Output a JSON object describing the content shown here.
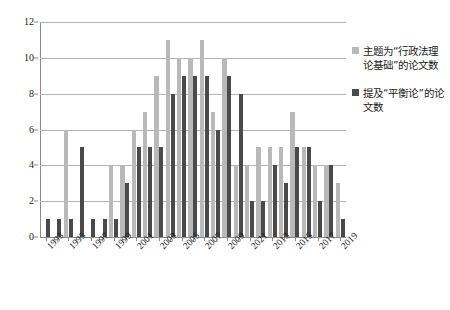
{
  "chart_data": {
    "type": "bar",
    "title": "",
    "xlabel": "",
    "ylabel": "",
    "ylim": [
      0,
      12
    ],
    "y_ticks": [
      0,
      2,
      4,
      6,
      8,
      10,
      12
    ],
    "grid": true,
    "legend_position": "right",
    "categories": [
      "1993",
      "1994",
      "1995",
      "1996",
      "1997",
      "1998",
      "1999",
      "2000",
      "2001",
      "2002",
      "2003",
      "2004",
      "2005",
      "2006",
      "2007",
      "2008",
      "2009",
      "2010",
      "2021",
      "2012",
      "2013",
      "2014",
      "2015",
      "2016",
      "2017",
      "2018",
      "2019"
    ],
    "x_tick_labels": [
      "1993",
      "1995",
      "1997",
      "1999",
      "2001",
      "2003",
      "2005",
      "2007",
      "2009",
      "2021",
      "2013",
      "2015",
      "2017",
      "2019"
    ],
    "series": [
      {
        "name": "主题为“行政法理论基础”的论文数",
        "color": "#b9b9b9",
        "values": [
          0,
          0,
          6,
          0,
          0,
          0,
          4,
          4,
          6,
          7,
          9,
          11,
          10,
          10,
          11,
          7,
          10,
          4,
          4,
          5,
          5,
          5,
          7,
          5,
          4,
          4,
          3
        ]
      },
      {
        "name": "提及“平衡论”的论文数",
        "color": "#4a4a4a",
        "values": [
          1,
          1,
          1,
          5,
          1,
          1,
          1,
          3,
          5,
          5,
          5,
          8,
          9,
          9,
          9,
          6,
          9,
          8,
          2,
          2,
          4,
          3,
          5,
          5,
          2,
          4,
          1
        ]
      }
    ]
  },
  "legend": {
    "items": [
      {
        "label": "主题为“行政法理论基础”的论文数",
        "swatch": "light-gray-square"
      },
      {
        "label": "提及“平衡论”的论文数",
        "swatch": "dark-gray-square"
      }
    ]
  }
}
